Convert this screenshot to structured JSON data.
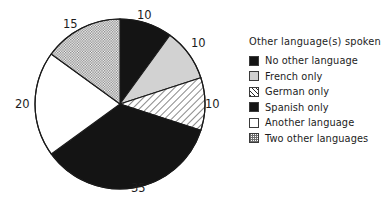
{
  "chart_data": {
    "type": "pie",
    "title": "",
    "legend_title": "Other language(s) spoken",
    "legend_position": "right",
    "categories": [
      "No other language",
      "French only",
      "German only",
      "Spanish only",
      "Another language",
      "Two other languages"
    ],
    "values": [
      10,
      10,
      10,
      35,
      20,
      15
    ],
    "value_labels": [
      "10",
      "10",
      "10",
      "35",
      "20",
      "15"
    ],
    "unit": "percent",
    "start_angle_deg": 0,
    "direction": "clockwise",
    "fills": [
      "solid-black",
      "light-gray",
      "diagonal-hatch",
      "solid-black",
      "white",
      "stipple-dots"
    ],
    "colors": [
      "#141414",
      "#d2d2d2",
      "#ffffff",
      "#141414",
      "#ffffff",
      "#ffffff"
    ],
    "outline_color": "#1a1a1a",
    "grid": false,
    "xlabel": "",
    "ylabel": ""
  },
  "pie": {
    "center_x": 120,
    "center_y": 104,
    "radius": 85,
    "slices": [
      {
        "name": "No other language",
        "value": 10,
        "label": "10",
        "start": 0,
        "end": 36,
        "fill": "solid-black",
        "label_x": 137,
        "label_y": 10
      },
      {
        "name": "French only",
        "value": 10,
        "label": "10",
        "start": 36,
        "end": 72,
        "fill": "light-gray",
        "label_x": 191,
        "label_y": 38
      },
      {
        "name": "German only",
        "value": 10,
        "label": "10",
        "start": 72,
        "end": 108,
        "fill": "diagonal-hatch",
        "label_x": 205,
        "label_y": 99
      },
      {
        "name": "Spanish only",
        "value": 35,
        "label": "35",
        "start": 108,
        "end": 234,
        "fill": "solid-black",
        "label_x": 131,
        "label_y": 183
      },
      {
        "name": "Another language",
        "value": 20,
        "label": "20",
        "start": 234,
        "end": 306,
        "fill": "white",
        "label_x": 15,
        "label_y": 99
      },
      {
        "name": "Two other languages",
        "value": 15,
        "label": "15",
        "start": 306,
        "end": 360,
        "fill": "stipple-dots",
        "label_x": 63,
        "label_y": 19
      }
    ]
  },
  "legend": {
    "title": "Other language(s) spoken",
    "items": [
      {
        "label": "No other language",
        "swatch": "solid-black"
      },
      {
        "label": "French only",
        "swatch": "light-gray"
      },
      {
        "label": "German only",
        "swatch": "diagonal-hatch"
      },
      {
        "label": "Spanish only",
        "swatch": "solid-black"
      },
      {
        "label": "Another language",
        "swatch": "white"
      },
      {
        "label": "Two other languages",
        "swatch": "stipple-dots"
      }
    ]
  }
}
